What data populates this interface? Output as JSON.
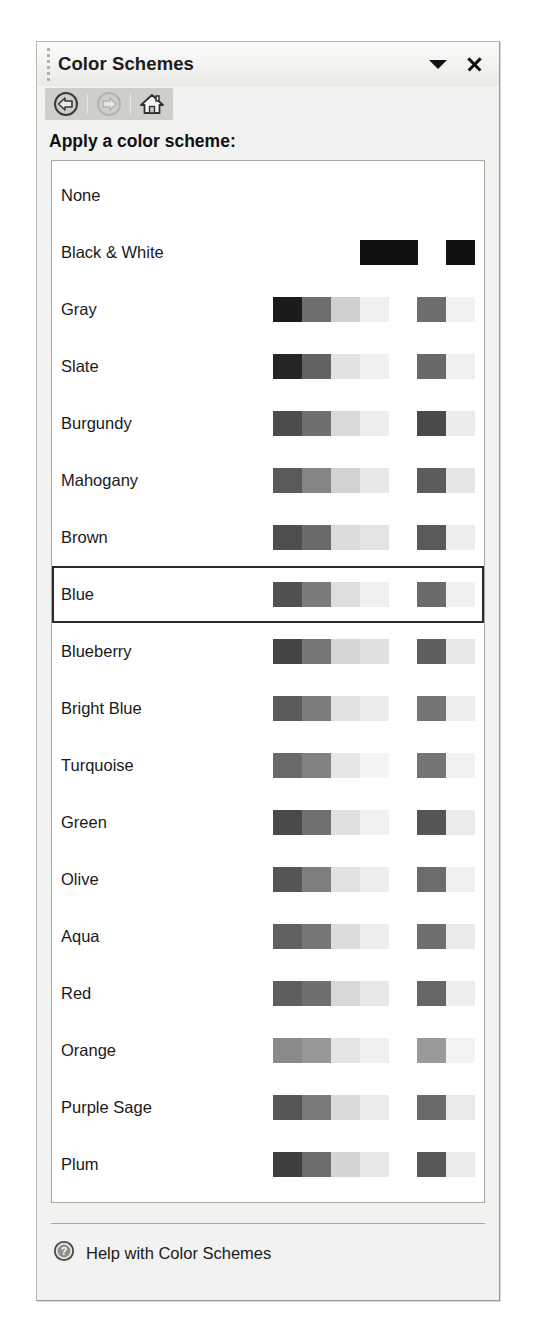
{
  "pane": {
    "title": "Color Schemes",
    "gripper_icon": "drag-gripper-icon",
    "dropdown_icon": "chevron-down-icon",
    "close_icon": "close-icon"
  },
  "toolbar": {
    "back": {
      "label": "Back",
      "icon": "back-arrow-icon",
      "enabled": true
    },
    "forward": {
      "label": "Forward",
      "icon": "forward-arrow-icon",
      "enabled": false
    },
    "home": {
      "label": "Home",
      "icon": "home-icon",
      "enabled": true
    }
  },
  "heading": "Apply a color scheme:",
  "list": {
    "selected": "Blue",
    "items": [
      {
        "label": "None",
        "swatches_left": [],
        "swatches_right": []
      },
      {
        "label": "Black & White",
        "swatches_left": [
          "#111111",
          "#111111"
        ],
        "swatches_right": [
          "#111111"
        ]
      },
      {
        "label": "Gray",
        "swatches_left": [
          "#1b1b1b",
          "#6e6e6e",
          "#cfcfcf",
          "#f0f0f0"
        ],
        "swatches_right": [
          "#6d6d6d",
          "#f2f2f2"
        ]
      },
      {
        "label": "Slate",
        "swatches_left": [
          "#252525",
          "#636363",
          "#e2e2e2",
          "#f0f0f0"
        ],
        "swatches_right": [
          "#696969",
          "#efefef"
        ]
      },
      {
        "label": "Burgundy",
        "swatches_left": [
          "#4c4c4c",
          "#6f6f6f",
          "#d9d9d9",
          "#ededed"
        ],
        "swatches_right": [
          "#4a4a4a",
          "#ececec"
        ]
      },
      {
        "label": "Mahogany",
        "swatches_left": [
          "#5a5a5a",
          "#858585",
          "#d2d2d2",
          "#e8e8e8"
        ],
        "swatches_right": [
          "#5c5c5c",
          "#e6e6e6"
        ]
      },
      {
        "label": "Brown",
        "swatches_left": [
          "#4e4e4e",
          "#6a6a6a",
          "#dcdcdc",
          "#e4e4e4"
        ],
        "swatches_right": [
          "#5a5a5a",
          "#ededed"
        ]
      },
      {
        "label": "Blue",
        "swatches_left": [
          "#515151",
          "#7b7b7b",
          "#dedede",
          "#efefef"
        ],
        "swatches_right": [
          "#6b6b6b",
          "#f0f0f0"
        ]
      },
      {
        "label": "Blueberry",
        "swatches_left": [
          "#454545",
          "#777777",
          "#d6d6d6",
          "#e0e0e0"
        ],
        "swatches_right": [
          "#5f5f5f",
          "#e7e7e7"
        ]
      },
      {
        "label": "Bright Blue",
        "swatches_left": [
          "#5b5b5b",
          "#7d7d7d",
          "#e2e2e2",
          "#ececec"
        ],
        "swatches_right": [
          "#747474",
          "#eeeeee"
        ]
      },
      {
        "label": "Turquoise",
        "swatches_left": [
          "#6a6a6a",
          "#828282",
          "#e6e6e6",
          "#f4f4f4"
        ],
        "swatches_right": [
          "#757575",
          "#f2f2f2"
        ]
      },
      {
        "label": "Green",
        "swatches_left": [
          "#4a4a4a",
          "#707070",
          "#e0e0e0",
          "#f1f1f1"
        ],
        "swatches_right": [
          "#555555",
          "#ebebeb"
        ]
      },
      {
        "label": "Olive",
        "swatches_left": [
          "#555555",
          "#7e7e7e",
          "#e1e1e1",
          "#eeeeee"
        ],
        "swatches_right": [
          "#6c6c6c",
          "#efefef"
        ]
      },
      {
        "label": "Aqua",
        "swatches_left": [
          "#606060",
          "#767676",
          "#dcdcdc",
          "#ededed"
        ],
        "swatches_right": [
          "#6e6e6e",
          "#eaeaea"
        ]
      },
      {
        "label": "Red",
        "swatches_left": [
          "#5e5e5e",
          "#6f6f6f",
          "#d8d8d8",
          "#e7e7e7"
        ],
        "swatches_right": [
          "#666666",
          "#ededed"
        ]
      },
      {
        "label": "Orange",
        "swatches_left": [
          "#8a8a8a",
          "#979797",
          "#e4e4e4",
          "#f0f0f0"
        ],
        "swatches_right": [
          "#9a9a9a",
          "#f3f3f3"
        ]
      },
      {
        "label": "Purple Sage",
        "swatches_left": [
          "#565656",
          "#7a7a7a",
          "#dadada",
          "#ebebeb"
        ],
        "swatches_right": [
          "#6a6a6a",
          "#e9e9e9"
        ]
      },
      {
        "label": "Plum",
        "swatches_left": [
          "#3f3f3f",
          "#6c6c6c",
          "#d4d4d4",
          "#e8e8e8"
        ],
        "swatches_right": [
          "#585858",
          "#ececec"
        ]
      }
    ]
  },
  "footer": {
    "help_label": "Help with Color Schemes",
    "help_icon": "help-circle-icon"
  }
}
